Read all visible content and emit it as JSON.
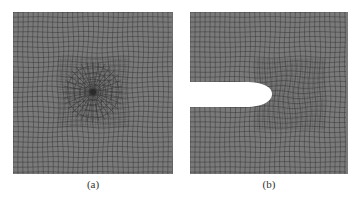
{
  "figure": {
    "panels": [
      {
        "id": "a",
        "caption": "(a)",
        "description": "Quadrilateral mesh of square domain with radial refinement around a central point",
        "feature": "central-singular-point"
      },
      {
        "id": "b",
        "caption": "(b)",
        "description": "Quadrilateral mesh of square domain with a horizontal elliptical notch from the left edge, refined near the notch tip",
        "feature": "edge-notch"
      }
    ],
    "colors": {
      "mesh_fill": "#7a7a7a",
      "mesh_line": "#2e2e2e",
      "background": "#ffffff",
      "notch_fill": "#ffffff"
    }
  }
}
